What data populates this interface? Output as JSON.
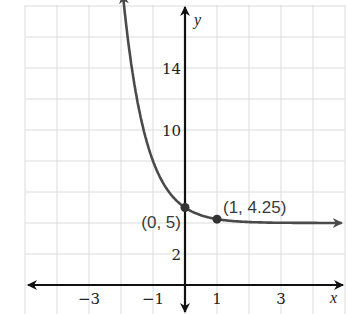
{
  "chart_data": {
    "type": "line",
    "title": "",
    "xlabel": "x",
    "ylabel": "y",
    "function": "y = 4 + (1/4)^x",
    "xlim": [
      -5,
      5
    ],
    "ylim": [
      -1,
      18
    ],
    "grid": true,
    "x_grid_step": 1,
    "y_grid_step": 2,
    "x_tick_labels": [
      {
        "value": -3,
        "label": "−3"
      },
      {
        "value": -1,
        "label": "−1"
      },
      {
        "value": 1,
        "label": "1"
      },
      {
        "value": 3,
        "label": "3"
      }
    ],
    "y_tick_labels": [
      {
        "value": 14,
        "label": "14"
      },
      {
        "value": 10,
        "label": "10"
      },
      {
        "value": 2,
        "label": "2"
      }
    ],
    "series": [
      {
        "name": "curve",
        "x": [
          -1.94,
          -1.75,
          -1.5,
          -1.25,
          -1,
          -0.75,
          -0.5,
          -0.25,
          0,
          0.25,
          0.5,
          0.75,
          1,
          1.5,
          2,
          2.5,
          3,
          3.5,
          4,
          4.9
        ],
        "y": [
          18.74,
          15.31,
          12.0,
          9.66,
          8.0,
          6.83,
          6.0,
          5.41,
          5.0,
          4.71,
          4.5,
          4.35,
          4.25,
          4.125,
          4.0625,
          4.03,
          4.016,
          4.008,
          4.004,
          4.001
        ],
        "color": "#4a4a4a",
        "arrows": [
          "start",
          "end"
        ],
        "asymptote_y": 4
      }
    ],
    "annotations": [
      {
        "x": 0,
        "y": 5,
        "label": "(0, 5)",
        "marker": "dot",
        "label_side": "left"
      },
      {
        "x": 1,
        "y": 4.25,
        "label": "(1, 4.25)",
        "marker": "dot",
        "label_side": "above-right"
      }
    ]
  },
  "colors": {
    "grid": "#dcdcdc",
    "axis": "#111111",
    "curve": "#4a4a4a",
    "point": "#333333"
  }
}
